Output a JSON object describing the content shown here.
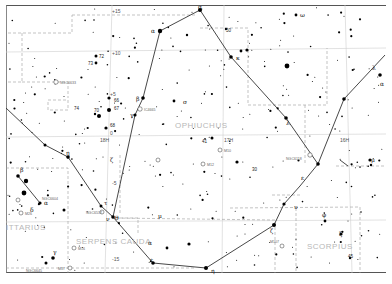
{
  "map": {
    "type": "star-chart",
    "constellations": [
      {
        "name": "Ophiuchus",
        "label": "OPHIUCHUS"
      },
      {
        "name": "Serpens Cauda",
        "label": "SERPENS CAUDA"
      },
      {
        "name": "Scorpius",
        "label": "SCORPIUS"
      },
      {
        "name": "Sagittarius (partial)",
        "label": "ITTARIUS"
      }
    ],
    "grid_labels": [
      {
        "text": "+15",
        "kind": "declination"
      },
      {
        "text": "+10",
        "kind": "declination"
      },
      {
        "text": "+5",
        "kind": "declination"
      },
      {
        "text": "0",
        "kind": "declination"
      },
      {
        "text": "-5",
        "kind": "declination"
      },
      {
        "text": "-15",
        "kind": "declination"
      },
      {
        "text": "18H",
        "kind": "right-ascension"
      },
      {
        "text": "17H",
        "kind": "right-ascension"
      },
      {
        "text": "16H",
        "kind": "right-ascension"
      }
    ],
    "deep_sky_objects": [
      {
        "id": "NGC6633"
      },
      {
        "id": "IC4665"
      },
      {
        "id": "M10"
      },
      {
        "id": "M12"
      },
      {
        "id": "M107"
      },
      {
        "id": "NGC6118"
      },
      {
        "id": "NGC6604"
      },
      {
        "id": "NGC6537"
      },
      {
        "id": "M16"
      },
      {
        "id": "M26"
      },
      {
        "id": "M17"
      },
      {
        "id": "NGC6645"
      }
    ],
    "star_labels": [
      "α",
      "β",
      "γ",
      "δ",
      "ε",
      "ζ",
      "η",
      "κ",
      "λ",
      "μ",
      "ν",
      "σ",
      "τ",
      "υ",
      "φ",
      "ω",
      "ξ",
      "ρ",
      "θ",
      "66",
      "67",
      "68",
      "70",
      "72",
      "73",
      "74",
      "41",
      "30",
      "50",
      "45",
      "50",
      "15"
    ],
    "colors": {
      "background": "#ffffff",
      "stars": "#000000",
      "figure_lines": "#333333",
      "boundaries": "#9a9a9a",
      "grid": "#c8c8c8",
      "constellation_label": "#b8b8b8"
    }
  }
}
